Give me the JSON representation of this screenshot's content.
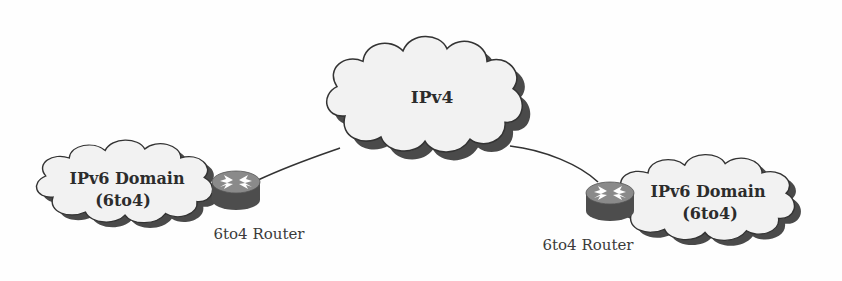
{
  "diagram": {
    "colors": {
      "cloud_fill": "#f2f2f2",
      "cloud_stroke": "#333333",
      "cloud_shadow": "#4a4a4a",
      "router_top": "#8a8a8a",
      "router_side": "#4d4d4d",
      "router_arrows": "#ffffff",
      "link": "#333333"
    },
    "nodes": [
      {
        "id": "ipv4-cloud",
        "type": "cloud",
        "label": "IPv4"
      },
      {
        "id": "left-ipv6-cloud",
        "type": "cloud",
        "label_line1": "IPv6 Domain",
        "label_line2": "(6to4)"
      },
      {
        "id": "right-ipv6-cloud",
        "type": "cloud",
        "label_line1": "IPv6 Domain",
        "label_line2": "(6to4)"
      },
      {
        "id": "left-router",
        "type": "router",
        "label": "6to4 Router"
      },
      {
        "id": "right-router",
        "type": "router",
        "label": "6to4 Router"
      }
    ],
    "edges": [
      {
        "from": "left-router",
        "to": "ipv4-cloud"
      },
      {
        "from": "ipv4-cloud",
        "to": "right-router"
      },
      {
        "from": "left-ipv6-cloud",
        "to": "left-router"
      },
      {
        "from": "right-router",
        "to": "right-ipv6-cloud"
      }
    ]
  }
}
